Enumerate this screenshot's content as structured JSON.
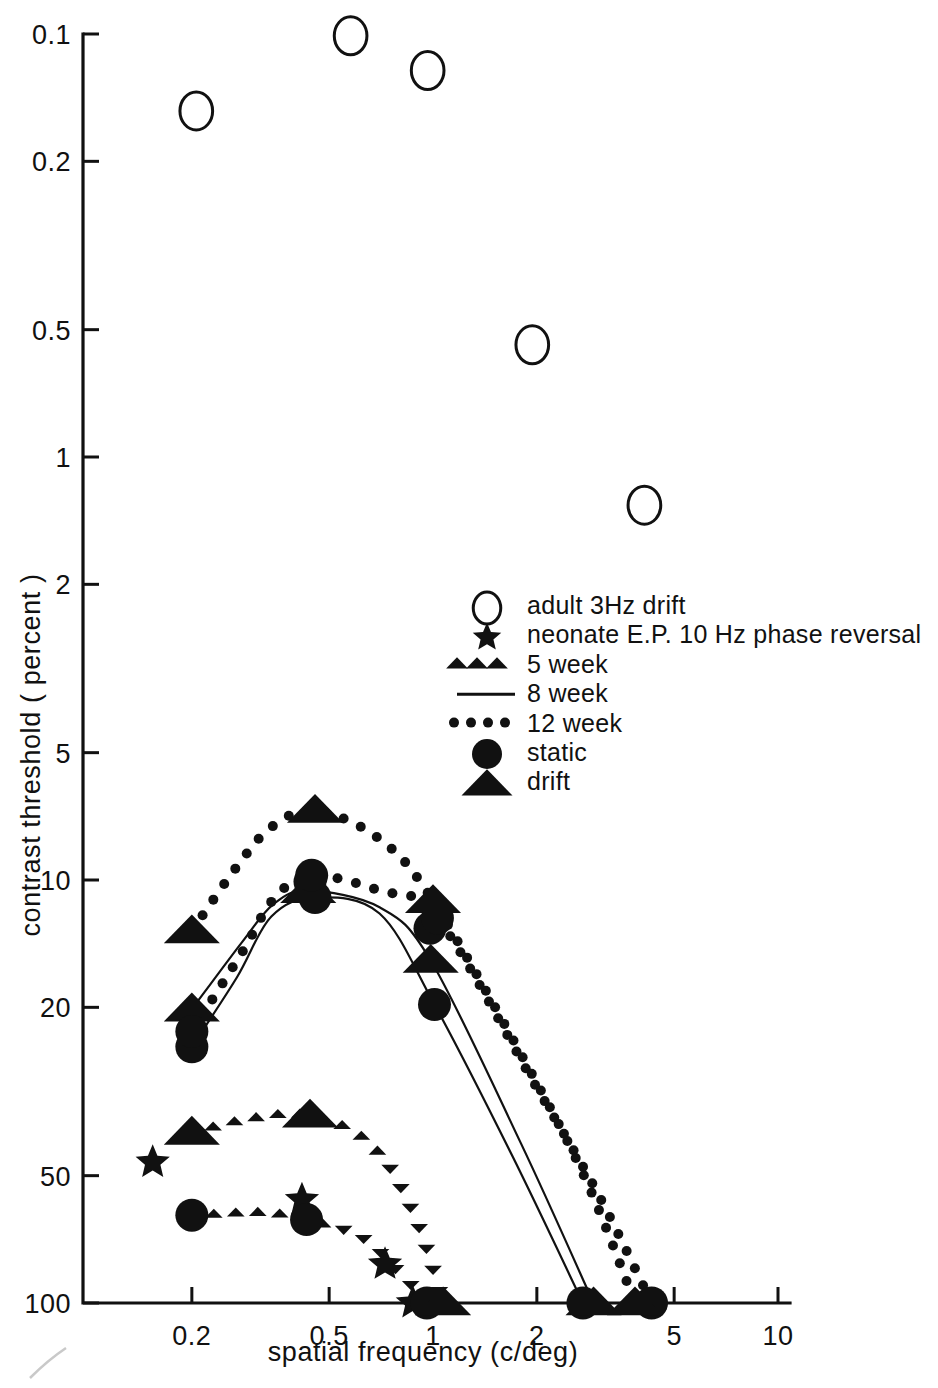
{
  "figure": {
    "background": "#ffffff",
    "ink_color": "#111111"
  },
  "axes": {
    "x": {
      "label": "spatial frequency (c/deg)",
      "scale": "log",
      "ticks": [
        "0.2",
        "0.5",
        "1",
        "2",
        "5",
        "10"
      ],
      "tick_values": [
        0.2,
        0.5,
        1,
        2,
        5,
        10
      ],
      "range": [
        0.1,
        10
      ]
    },
    "y": {
      "label": "contrast threshold ( percent )",
      "scale": "log",
      "inverted": true,
      "ticks": [
        "0.1",
        "0.2",
        "0.5",
        "1",
        "2",
        "5",
        "10",
        "20",
        "50",
        "100"
      ],
      "tick_values": [
        0.1,
        0.2,
        0.5,
        1,
        2,
        5,
        10,
        20,
        50,
        100
      ],
      "range": [
        0.1,
        100
      ]
    }
  },
  "legend": {
    "position": "center-right",
    "items": [
      {
        "marker": "open-circle",
        "label": "adult  3Hz drift"
      },
      {
        "marker": "star",
        "label": "neonate  E.P. 10 Hz  phase reversal"
      },
      {
        "marker": "dotted-triangles",
        "label": "5 week"
      },
      {
        "marker": "solid-line",
        "label": "8 week"
      },
      {
        "marker": "dotted-circles",
        "label": "12 week"
      },
      {
        "marker": "filled-circle",
        "label": "static"
      },
      {
        "marker": "filled-triangle",
        "label": "drift"
      }
    ]
  },
  "chart_data": {
    "type": "scatter",
    "title": "",
    "xlabel": "spatial frequency (c/deg)",
    "ylabel": "contrast threshold ( percent )",
    "xscale": "log",
    "yscale": "log",
    "y_inverted": true,
    "xlim": [
      0.1,
      10
    ],
    "ylim": [
      0.1,
      100
    ],
    "grid": false,
    "series": [
      {
        "name": "adult 3Hz drift",
        "marker": "open-circle",
        "points": [
          {
            "x": 0.206,
            "y": 0.152
          },
          {
            "x": 0.577,
            "y": 0.101
          },
          {
            "x": 0.965,
            "y": 0.122
          },
          {
            "x": 1.94,
            "y": 0.543
          },
          {
            "x": 4.1,
            "y": 1.3
          }
        ]
      },
      {
        "name": "neonate E.P. 10 Hz phase reversal",
        "marker": "star",
        "points": [
          {
            "x": 0.154,
            "y": 46.5
          },
          {
            "x": 0.417,
            "y": 57.0
          },
          {
            "x": 0.726,
            "y": 81.0
          },
          {
            "x": 0.874,
            "y": 100
          }
        ]
      },
      {
        "name": "5 week static",
        "marker": "filled-circle",
        "curve": "dotted-triangles",
        "points": [
          {
            "x": 0.2,
            "y": 62.0
          },
          {
            "x": 0.43,
            "y": 63.5
          },
          {
            "x": 0.96,
            "y": 100
          }
        ]
      },
      {
        "name": "5 week drift",
        "marker": "filled-triangle",
        "curve": "dotted-triangles",
        "points": [
          {
            "x": 0.2,
            "y": 39.5
          },
          {
            "x": 0.44,
            "y": 36.0
          },
          {
            "x": 1.07,
            "y": 100
          }
        ]
      },
      {
        "name": "8 week static",
        "marker": "filled-circle",
        "curve": "solid-line",
        "points": [
          {
            "x": 0.2,
            "y": 24.8
          },
          {
            "x": 0.44,
            "y": 10.1
          },
          {
            "x": 0.455,
            "y": 11.0
          },
          {
            "x": 0.98,
            "y": 13.0
          },
          {
            "x": 1.01,
            "y": 19.7
          },
          {
            "x": 2.72,
            "y": 100
          }
        ]
      },
      {
        "name": "8 week drift",
        "marker": "filled-triangle",
        "curve": "solid-line",
        "points": [
          {
            "x": 0.2,
            "y": 20.2
          },
          {
            "x": 0.435,
            "y": 10.6
          },
          {
            "x": 0.985,
            "y": 15.5
          },
          {
            "x": 2.92,
            "y": 100
          }
        ]
      },
      {
        "name": "12 week static",
        "marker": "filled-circle",
        "curve": "dotted-circles",
        "points": [
          {
            "x": 0.2,
            "y": 22.8
          },
          {
            "x": 0.445,
            "y": 9.75
          },
          {
            "x": 1.03,
            "y": 12.3
          },
          {
            "x": 4.3,
            "y": 100
          }
        ]
      },
      {
        "name": "12 week drift",
        "marker": "filled-triangle",
        "curve": "dotted-circles",
        "points": [
          {
            "x": 0.2,
            "y": 13.2
          },
          {
            "x": 0.455,
            "y": 6.85
          },
          {
            "x": 1.0,
            "y": 11.2
          },
          {
            "x": 3.85,
            "y": 100
          }
        ]
      }
    ]
  }
}
